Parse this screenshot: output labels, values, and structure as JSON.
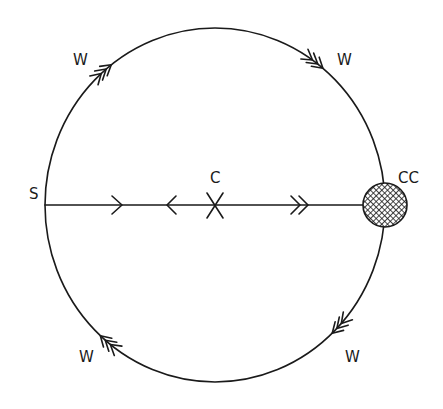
{
  "diagram": {
    "labels": {
      "saddle": "S",
      "center": "C",
      "attractor": "CC",
      "boundary_top_left": "W",
      "boundary_top_right": "W",
      "boundary_bottom_left": "W",
      "boundary_bottom_right": "W"
    },
    "arrows": {
      "diameter_left_segment": {
        "direction": "right",
        "count": 1
      },
      "diameter_center_left": {
        "direction": "left",
        "count": 1
      },
      "diameter_right_segment": {
        "direction": "right",
        "count": 2
      },
      "boundary_top_left": {
        "direction": "clockwise",
        "count": 3
      },
      "boundary_top_right": {
        "direction": "clockwise",
        "count": 3
      },
      "boundary_bottom_right": {
        "direction": "clockwise",
        "count": 3
      },
      "boundary_bottom_left": {
        "direction": "clockwise",
        "count": 3
      }
    },
    "colors": {
      "ink": "#1a1a1a",
      "background": "#ffffff"
    }
  }
}
